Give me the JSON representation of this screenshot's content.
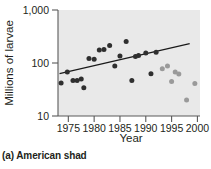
{
  "caption": "(a) American shad",
  "chart_data": {
    "type": "scatter",
    "title": "",
    "xlabel": "Year",
    "ylabel": "Millions of larvae",
    "yscale": "log",
    "ylim": [
      10,
      1000
    ],
    "xlim": [
      1973,
      2000.5
    ],
    "xticks": [
      1975,
      1980,
      1985,
      1990,
      1995,
      2000
    ],
    "xticklabels": [
      "1975",
      "1980",
      "1985",
      "1990",
      "1995",
      "2000"
    ],
    "yticks": [
      10,
      100,
      1000
    ],
    "yticklabels": [
      "10",
      "100",
      "1,000"
    ],
    "grid": false,
    "legend": "none",
    "plot_background": "#e9e9e9",
    "colors": {
      "dark_points": "#2f2f2f",
      "light_points": "#9a9a9a",
      "trend_line": "#1a1a1a",
      "axis": "#5a5a5a"
    },
    "series": [
      {
        "name": "dark-period",
        "color": "#2f2f2f",
        "points": [
          {
            "x": 1973.6,
            "y": 42
          },
          {
            "x": 1974.8,
            "y": 68
          },
          {
            "x": 1975.9,
            "y": 47
          },
          {
            "x": 1976.7,
            "y": 47
          },
          {
            "x": 1977.5,
            "y": 50
          },
          {
            "x": 1978.0,
            "y": 34
          },
          {
            "x": 1979.0,
            "y": 122
          },
          {
            "x": 1980.0,
            "y": 118
          },
          {
            "x": 1981.0,
            "y": 175
          },
          {
            "x": 1981.9,
            "y": 180
          },
          {
            "x": 1983.0,
            "y": 215
          },
          {
            "x": 1984.0,
            "y": 88
          },
          {
            "x": 1985.0,
            "y": 135
          },
          {
            "x": 1986.2,
            "y": 255
          },
          {
            "x": 1987.3,
            "y": 47
          },
          {
            "x": 1988.0,
            "y": 132
          },
          {
            "x": 1988.6,
            "y": 138
          },
          {
            "x": 1990.0,
            "y": 155
          },
          {
            "x": 1991.0,
            "y": 63
          },
          {
            "x": 1992.0,
            "y": 160
          }
        ]
      },
      {
        "name": "light-period",
        "color": "#9a9a9a",
        "points": [
          {
            "x": 1993.2,
            "y": 78
          },
          {
            "x": 1994.2,
            "y": 88
          },
          {
            "x": 1995.0,
            "y": 45
          },
          {
            "x": 1995.7,
            "y": 68
          },
          {
            "x": 1996.4,
            "y": 62
          },
          {
            "x": 1997.9,
            "y": 20
          },
          {
            "x": 1999.5,
            "y": 41
          }
        ]
      }
    ],
    "trend_line": {
      "name": "regression-line",
      "x_start": 1973.3,
      "y_start": 63,
      "x_end": 1998.5,
      "y_end": 232
    }
  }
}
